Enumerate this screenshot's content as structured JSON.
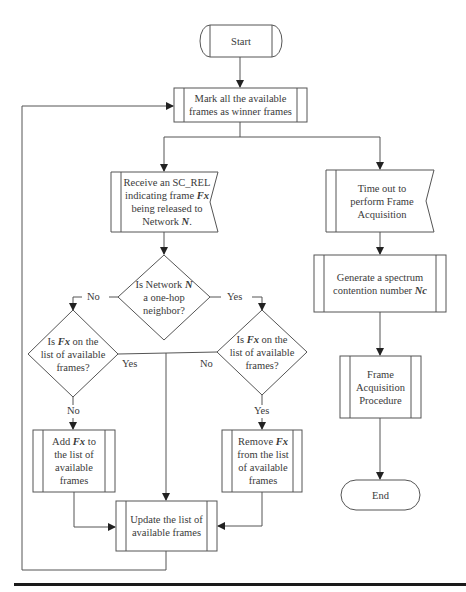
{
  "diagram": {
    "type": "flowchart",
    "stroke_color": "#555555",
    "text_color": "#3a3a3a",
    "nodes": {
      "start": {
        "shape": "terminator",
        "label": "Start"
      },
      "mark": {
        "shape": "predefined-process",
        "line1": "Mark all the available",
        "line2": "frames as winner frames"
      },
      "receive": {
        "shape": "event-flag",
        "line1": "Receive an SC_REL",
        "line2_pre": "indicating frame ",
        "line2_var": "Fx",
        "line3": "being released to",
        "line4_pre": "Network ",
        "line4_var": "N",
        "line4_post": "."
      },
      "timeout": {
        "shape": "event-flag",
        "line1": "Time out to",
        "line2": "perform Frame",
        "line3": "Acquisition"
      },
      "decision_neighbor": {
        "shape": "decision",
        "line1_pre": "Is Network ",
        "line1_var": "N",
        "line2": "a one-hop",
        "line3": "neighbor?"
      },
      "decision_left": {
        "shape": "decision",
        "line1_pre": "Is ",
        "line1_var": "Fx",
        "line1_post": " on the",
        "line2": "list of available",
        "line3": "frames?"
      },
      "decision_right": {
        "shape": "decision",
        "line1_pre": "Is ",
        "line1_var": "Fx",
        "line1_post": " on the",
        "line2": "list of available",
        "line3": "frames?"
      },
      "generate": {
        "shape": "predefined-process",
        "line1": "Generate a spectrum",
        "line2_pre": "contention number ",
        "line2_var": "Nc"
      },
      "acquisition": {
        "shape": "predefined-process",
        "line1": "Frame",
        "line2": "Acquisition",
        "line3": "Procedure"
      },
      "end": {
        "shape": "terminator",
        "label": "End"
      },
      "add": {
        "shape": "predefined-process",
        "line1_pre": "Add ",
        "line1_var": "Fx",
        "line1_post": " to",
        "line2": "the list of",
        "line3": "available",
        "line4": "frames"
      },
      "remove": {
        "shape": "predefined-process",
        "line1_pre": "Remove ",
        "line1_var": "Fx",
        "line2": "from the list",
        "line3": "of available",
        "line4": "frames"
      },
      "update": {
        "shape": "predefined-process",
        "line1": "Update the list of",
        "line2": "available frames"
      }
    },
    "edge_labels": {
      "neighbor_no": "No",
      "neighbor_yes": "Yes",
      "left_yes": "Yes",
      "left_no": "No",
      "right_no": "No",
      "right_yes": "Yes"
    },
    "edges": [
      {
        "from": "start",
        "to": "mark"
      },
      {
        "from": "mark",
        "to": "receive"
      },
      {
        "from": "mark",
        "to": "timeout"
      },
      {
        "from": "receive",
        "to": "decision_neighbor"
      },
      {
        "from": "decision_neighbor",
        "to": "decision_left",
        "label": "No"
      },
      {
        "from": "decision_neighbor",
        "to": "decision_right",
        "label": "Yes"
      },
      {
        "from": "decision_left",
        "to": "add",
        "label": "No"
      },
      {
        "from": "decision_left",
        "to": "update",
        "label": "Yes"
      },
      {
        "from": "decision_right",
        "to": "remove",
        "label": "Yes"
      },
      {
        "from": "decision_right",
        "to": "update",
        "label": "No"
      },
      {
        "from": "add",
        "to": "update"
      },
      {
        "from": "remove",
        "to": "update"
      },
      {
        "from": "update",
        "to": "mark"
      },
      {
        "from": "timeout",
        "to": "generate"
      },
      {
        "from": "generate",
        "to": "acquisition"
      },
      {
        "from": "acquisition",
        "to": "end"
      }
    ]
  }
}
